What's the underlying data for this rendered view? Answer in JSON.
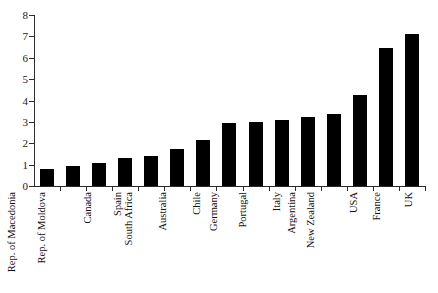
{
  "chart_data": {
    "type": "bar",
    "title": "",
    "xlabel": "",
    "ylabel": "",
    "ylim": [
      0,
      8
    ],
    "yticks": [
      0,
      1,
      2,
      3,
      4,
      5,
      6,
      7,
      8
    ],
    "ytick_labels": [
      "0",
      "1",
      "2",
      "3",
      "4",
      "5",
      "6",
      "7",
      "8"
    ],
    "grid": false,
    "legend": false,
    "bar_color": "#000000",
    "axis_color": "#2b2b2b",
    "categories": [
      "Rep. of Macedonia",
      "Rep. of Moldova",
      "Canada",
      "Spain",
      "South Africa",
      "Australia",
      "Chile",
      "Germany",
      "Portugal",
      "Italy",
      "Argentina",
      "New Zealand",
      "USA",
      "France",
      "UK"
    ],
    "values": [
      0.78,
      0.92,
      1.07,
      1.33,
      1.4,
      1.74,
      2.13,
      2.95,
      2.99,
      3.1,
      3.24,
      3.37,
      4.24,
      6.45,
      7.12
    ]
  }
}
